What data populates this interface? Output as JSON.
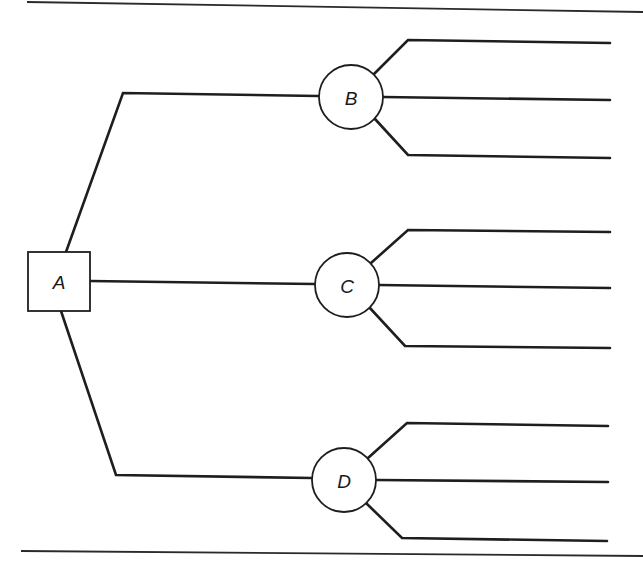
{
  "diagram": {
    "type": "decision-tree",
    "colors": {
      "line": "#1e1e1e",
      "background": "#ffffff"
    },
    "nodes": [
      {
        "id": "A",
        "label": "A",
        "shape": "square"
      },
      {
        "id": "B",
        "label": "B",
        "shape": "circle"
      },
      {
        "id": "C",
        "label": "C",
        "shape": "circle"
      },
      {
        "id": "D",
        "label": "D",
        "shape": "circle"
      }
    ],
    "edges": [
      {
        "from": "A",
        "to": "B"
      },
      {
        "from": "A",
        "to": "C"
      },
      {
        "from": "A",
        "to": "D"
      },
      {
        "from": "B",
        "to": "outcome",
        "count": 3
      },
      {
        "from": "C",
        "to": "outcome",
        "count": 3
      },
      {
        "from": "D",
        "to": "outcome",
        "count": 3
      }
    ]
  }
}
